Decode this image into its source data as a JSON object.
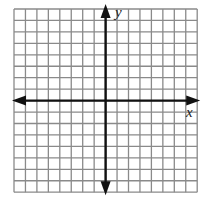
{
  "diagram": {
    "type": "coordinate-plane",
    "grid": {
      "columns": 16,
      "rows": 16,
      "left": 14,
      "top": 9,
      "cell_size": 11.45,
      "line_color": "#8a8a8a",
      "line_width": 1.3,
      "background": "#ffffff"
    },
    "axes": {
      "color": "#111111",
      "width": 2.4,
      "origin_col": 8,
      "origin_row": 8,
      "x_label": "x",
      "y_label": "y",
      "arrows": [
        "left",
        "right",
        "up",
        "down"
      ]
    }
  }
}
